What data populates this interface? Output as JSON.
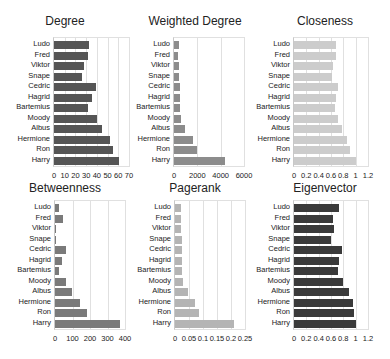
{
  "chart_data": [
    {
      "type": "bar",
      "orientation": "horizontal",
      "title": "Degree",
      "categories": [
        "Ludo",
        "Fred",
        "Viktor",
        "Snape",
        "Cedric",
        "Hagrid",
        "Bartemius",
        "Moody",
        "Albus",
        "Hermione",
        "Ron",
        "Harry"
      ],
      "values": [
        33,
        32,
        28,
        26,
        39,
        35,
        32,
        40,
        45,
        52,
        55,
        61
      ],
      "xlim": [
        0,
        70
      ],
      "ticks": [
        "0",
        "10",
        "20",
        "30",
        "40",
        "50",
        "60",
        "70"
      ],
      "color": "#555555",
      "grid": true
    },
    {
      "type": "bar",
      "orientation": "horizontal",
      "title": "Weighted Degree",
      "categories": [
        "Ludo",
        "Fred",
        "Viktor",
        "Snape",
        "Cedric",
        "Hagrid",
        "Bartemius",
        "Moody",
        "Albus",
        "Hermione",
        "Ron",
        "Harry"
      ],
      "values": [
        400,
        380,
        420,
        450,
        500,
        520,
        530,
        620,
        900,
        1600,
        2000,
        4400
      ],
      "xlim": [
        0,
        6000
      ],
      "ticks": [
        "0",
        "2000",
        "4000",
        "6000"
      ],
      "color": "#8c8c8c",
      "grid": true
    },
    {
      "type": "bar",
      "orientation": "horizontal",
      "title": "Closeness",
      "categories": [
        "Ludo",
        "Fred",
        "Viktor",
        "Snape",
        "Cedric",
        "Hagrid",
        "Bartemius",
        "Moody",
        "Albus",
        "Hermione",
        "Ron",
        "Harry"
      ],
      "values": [
        0.68,
        0.68,
        0.64,
        0.62,
        0.72,
        0.68,
        0.66,
        0.72,
        0.78,
        0.86,
        0.9,
        1.0
      ],
      "xlim": [
        0,
        1.2
      ],
      "ticks": [
        "0",
        "0.2",
        "0.4",
        "0.6",
        "0.8",
        "1",
        "1.2"
      ],
      "color": "#cccccc",
      "grid": true
    },
    {
      "type": "bar",
      "orientation": "horizontal",
      "title": "Betweenness",
      "categories": [
        "Ludo",
        "Fred",
        "Viktor",
        "Snape",
        "Cedric",
        "Hagrid",
        "Bartemius",
        "Moody",
        "Albus",
        "Hermione",
        "Ron",
        "Harry"
      ],
      "values": [
        25,
        45,
        8,
        5,
        65,
        40,
        20,
        65,
        95,
        140,
        185,
        370
      ],
      "xlim": [
        0,
        400
      ],
      "ticks": [
        "0",
        "100",
        "200",
        "300",
        "400"
      ],
      "color": "#7a7a7a",
      "grid": true
    },
    {
      "type": "bar",
      "orientation": "horizontal",
      "title": "Pagerank",
      "categories": [
        "Ludo",
        "Fred",
        "Viktor",
        "Snape",
        "Cedric",
        "Hagrid",
        "Bartemius",
        "Moody",
        "Albus",
        "Hermione",
        "Ron",
        "Harry"
      ],
      "values": [
        0.02,
        0.02,
        0.02,
        0.025,
        0.025,
        0.025,
        0.025,
        0.03,
        0.045,
        0.07,
        0.085,
        0.21
      ],
      "xlim": [
        0,
        0.25
      ],
      "ticks": [
        "0",
        "0.05",
        "0.1",
        "0.15",
        "0.2",
        "0.25"
      ],
      "color": "#b4b4b4",
      "grid": true
    },
    {
      "type": "bar",
      "orientation": "horizontal",
      "title": "Eigenvector",
      "categories": [
        "Ludo",
        "Fred",
        "Viktor",
        "Snape",
        "Cedric",
        "Hagrid",
        "Bartemius",
        "Moody",
        "Albus",
        "Hermione",
        "Ron",
        "Harry"
      ],
      "values": [
        0.73,
        0.63,
        0.65,
        0.6,
        0.78,
        0.73,
        0.71,
        0.8,
        0.89,
        0.95,
        0.97,
        1.0
      ],
      "xlim": [
        0,
        1.2
      ],
      "ticks": [
        "0",
        "0.2",
        "0.4",
        "0.6",
        "0.8",
        "1",
        "1.2"
      ],
      "color": "#3a3a3a",
      "grid": true
    }
  ]
}
